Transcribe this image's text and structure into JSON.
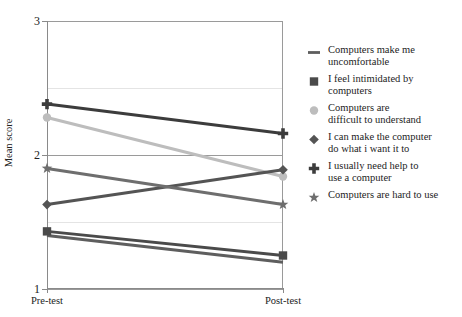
{
  "chart_data": {
    "type": "line",
    "title": "",
    "xlabel": "",
    "ylabel": "Mean score",
    "categories": [
      "Pre-test",
      "Post-test"
    ],
    "x": [
      0,
      1
    ],
    "ylim": [
      1,
      3
    ],
    "yticks": [
      1,
      2,
      3
    ],
    "ytick_labels": [
      "1",
      "2",
      "3"
    ],
    "minor_gridlines": [
      1.5,
      2.5
    ],
    "grid": true,
    "legend_position": "right",
    "series": [
      {
        "name": "Computers make me uncomfortable",
        "marker": "dash-line-marker",
        "color": "#5e5e5e",
        "values": [
          1.4,
          1.2
        ]
      },
      {
        "name": "I feel intimidated by computers",
        "marker": "square-marker",
        "color": "#4a4a4a",
        "values": [
          1.43,
          1.25
        ]
      },
      {
        "name": "Computers are difficult to understand",
        "marker": "circle-marker",
        "color": "#bdbdbd",
        "values": [
          2.28,
          1.84
        ]
      },
      {
        "name": "I can make the computer do what i want it to",
        "marker": "diamond-marker",
        "color": "#545454",
        "values": [
          1.63,
          1.89
        ]
      },
      {
        "name": "I usually need help to use a computer",
        "marker": "plus-marker",
        "color": "#3c3c3c",
        "values": [
          2.38,
          2.16
        ]
      },
      {
        "name": "Computers are hard to use",
        "marker": "star-marker",
        "color": "#6e6e6e",
        "values": [
          1.9,
          1.63
        ]
      }
    ]
  },
  "axes": {
    "y_title": "Mean score",
    "y_labels": [
      "3",
      "2",
      "1"
    ],
    "x_labels": [
      "Pre-test",
      "Post-test"
    ]
  },
  "legend": {
    "items": [
      {
        "label": "Computers make me\nuncomfortable",
        "marker": "dash-line-marker",
        "color": "#5e5e5e"
      },
      {
        "label": "I feel intimidated by\ncomputers",
        "marker": "square-marker",
        "color": "#4a4a4a"
      },
      {
        "label": "Computers are\ndifficult to understand",
        "marker": "circle-marker",
        "color": "#bdbdbd"
      },
      {
        "label": "I can make the computer\ndo what i want it to",
        "marker": "diamond-marker",
        "color": "#545454"
      },
      {
        "label": "I usually need help to\nuse a computer",
        "marker": "plus-marker",
        "color": "#3c3c3c"
      },
      {
        "label": "Computers are hard to use",
        "marker": "star-marker",
        "color": "#6e6e6e"
      }
    ]
  }
}
